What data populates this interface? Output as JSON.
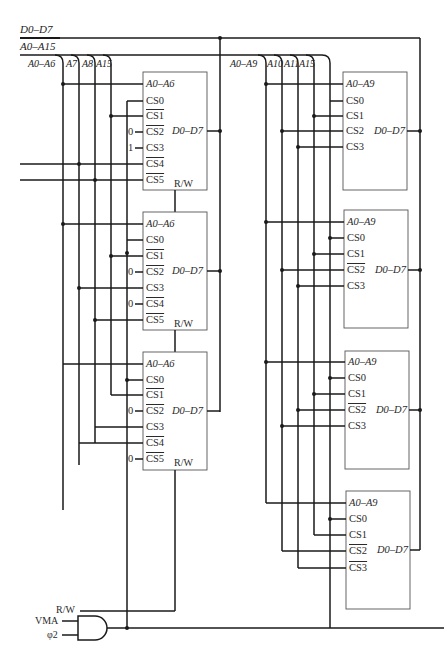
{
  "buses": {
    "data_bus": "D0–D7",
    "address_bus": "A0–A15"
  },
  "left_bank": {
    "taps": [
      "A0–A6",
      "A7",
      "A8",
      "A15"
    ],
    "chips": [
      {
        "addr": "A0–A6",
        "data": "D0–D7",
        "rw": "R/W",
        "pins": [
          "CS0",
          "CS1",
          "CS2",
          "CS3",
          "CS4",
          "CS5"
        ],
        "active_low": [
          false,
          true,
          true,
          false,
          true,
          true
        ],
        "ties": {
          "2": "0",
          "3": "1"
        }
      },
      {
        "addr": "A0–A6",
        "data": "D0–D7",
        "rw": "R/W",
        "pins": [
          "CS0",
          "CS1",
          "CS2",
          "CS3",
          "CS4",
          "CS5"
        ],
        "active_low": [
          false,
          true,
          true,
          false,
          true,
          true
        ],
        "ties": {
          "2": "0",
          "4": "0"
        }
      },
      {
        "addr": "A0–A6",
        "data": "D0–D7",
        "rw": "R/W",
        "pins": [
          "CS0",
          "CS1",
          "CS2",
          "CS3",
          "CS4",
          "CS5"
        ],
        "active_low": [
          false,
          true,
          true,
          false,
          true,
          true
        ],
        "ties": {
          "2": "0",
          "5": "0"
        }
      }
    ]
  },
  "right_bank": {
    "taps": [
      "A0–A9",
      "A10",
      "A11",
      "A15"
    ],
    "chips": [
      {
        "addr": "A0–A9",
        "data": "D0–D7",
        "pins": [
          "CS0",
          "CS1",
          "CS2",
          "CS3"
        ],
        "active_low": [
          false,
          false,
          false,
          false
        ]
      },
      {
        "addr": "A0–A9",
        "data": "D0–D7",
        "pins": [
          "CS0",
          "CS1",
          "CS2",
          "CS3"
        ],
        "active_low": [
          false,
          false,
          true,
          false
        ]
      },
      {
        "addr": "A0–A9",
        "data": "D0–D7",
        "pins": [
          "CS0",
          "CS1",
          "CS2",
          "CS3"
        ],
        "active_low": [
          false,
          false,
          true,
          false
        ]
      },
      {
        "addr": "A0–A9",
        "data": "D0–D7",
        "pins": [
          "CS0",
          "CS1",
          "CS2",
          "CS3"
        ],
        "active_low": [
          false,
          false,
          true,
          true
        ]
      }
    ]
  },
  "control": {
    "rw": "R/W",
    "vma": "VMA",
    "phi2": "φ2",
    "gate": "AND"
  }
}
